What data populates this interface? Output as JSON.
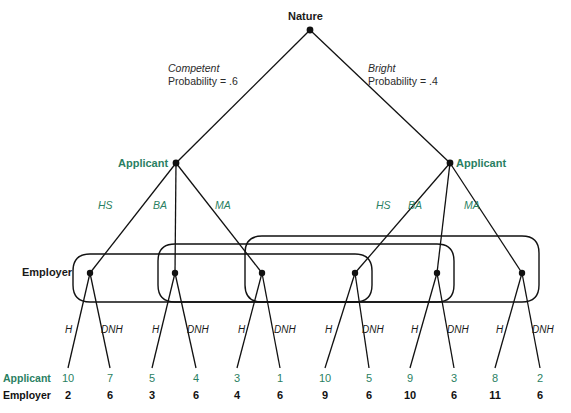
{
  "diagram": {
    "colors": {
      "teal": "#2a7f62",
      "dark": "#111111",
      "line": "#111111"
    },
    "nature": {
      "label": "Nature",
      "x": 310,
      "y": 30
    },
    "chance_branches": [
      {
        "type": "Competent",
        "probability_text": "Probability = .6",
        "probability": 0.6,
        "label_x": 168,
        "label_y": 68
      },
      {
        "type": "Bright",
        "probability_text": "Probability = .4",
        "probability": 0.4,
        "label_x": 368,
        "label_y": 68
      }
    ],
    "applicant_nodes": [
      {
        "label": "Applicant",
        "x": 176,
        "y": 163,
        "label_x": 118,
        "label_y": 158,
        "align": "right"
      },
      {
        "label": "Applicant",
        "x": 450,
        "y": 163,
        "label_x": 456,
        "label_y": 158,
        "align": "left"
      }
    ],
    "employer_label": {
      "label": "Employer",
      "x": 22,
      "y": 271
    },
    "signal_labels": [
      {
        "text": "HS",
        "x": 110,
        "y": 205
      },
      {
        "text": "BA",
        "x": 158,
        "y": 205
      },
      {
        "text": "MA",
        "x": 222,
        "y": 205
      },
      {
        "text": "HS",
        "x": 383,
        "y": 205
      },
      {
        "text": "BA",
        "x": 414,
        "y": 205
      },
      {
        "text": "MA",
        "x": 470,
        "y": 205
      }
    ],
    "employer_nodes": [
      {
        "id": "e1",
        "signal": "HS",
        "type": "Competent",
        "x": 90,
        "y": 273
      },
      {
        "id": "e2",
        "signal": "BA",
        "type": "Competent",
        "x": 175,
        "y": 273
      },
      {
        "id": "e3",
        "signal": "MA",
        "type": "Competent",
        "x": 262,
        "y": 273
      },
      {
        "id": "e4",
        "signal": "HS",
        "type": "Bright",
        "x": 355,
        "y": 273
      },
      {
        "id": "e5",
        "signal": "BA",
        "type": "Bright",
        "x": 437,
        "y": 273
      },
      {
        "id": "e6",
        "signal": "MA",
        "type": "Bright",
        "x": 522,
        "y": 273
      }
    ],
    "information_sets": [
      {
        "signal": "HS",
        "nodes": [
          "e1",
          "e4"
        ]
      },
      {
        "signal": "BA",
        "nodes": [
          "e2",
          "e5"
        ]
      },
      {
        "signal": "MA",
        "nodes": [
          "e3",
          "e6"
        ]
      }
    ],
    "action_labels": [
      {
        "text": "H",
        "x": 70,
        "y": 330
      },
      {
        "text": "DNH",
        "x": 110,
        "y": 330
      },
      {
        "text": "H",
        "x": 157,
        "y": 330
      },
      {
        "text": "DNH",
        "x": 196,
        "y": 330
      },
      {
        "text": "H",
        "x": 243,
        "y": 330
      },
      {
        "text": "DNH",
        "x": 283,
        "y": 330
      },
      {
        "text": "H",
        "x": 330,
        "y": 330
      },
      {
        "text": "DNH",
        "x": 371,
        "y": 330
      },
      {
        "text": "H",
        "x": 416,
        "y": 330
      },
      {
        "text": "DNH",
        "x": 456,
        "y": 330
      },
      {
        "text": "H",
        "x": 501,
        "y": 330
      },
      {
        "text": "DNH",
        "x": 542,
        "y": 330
      }
    ],
    "payoffs": {
      "row_labels": {
        "applicant": "Applicant",
        "employer": "Employer"
      },
      "terminals": [
        {
          "x": 68,
          "applicant": "10",
          "employer": "2"
        },
        {
          "x": 110,
          "applicant": "7",
          "employer": "6"
        },
        {
          "x": 152,
          "applicant": "5",
          "employer": "3"
        },
        {
          "x": 196,
          "applicant": "4",
          "employer": "6"
        },
        {
          "x": 237,
          "applicant": "3",
          "employer": "4"
        },
        {
          "x": 280,
          "applicant": "1",
          "employer": "6"
        },
        {
          "x": 325,
          "applicant": "10",
          "employer": "9"
        },
        {
          "x": 369,
          "applicant": "5",
          "employer": "6"
        },
        {
          "x": 410,
          "applicant": "9",
          "employer": "10"
        },
        {
          "x": 454,
          "applicant": "3",
          "employer": "6"
        },
        {
          "x": 495,
          "applicant": "8",
          "employer": "11"
        },
        {
          "x": 540,
          "applicant": "2",
          "employer": "6"
        }
      ],
      "applicant_row_y": 377,
      "employer_row_y": 394
    }
  }
}
